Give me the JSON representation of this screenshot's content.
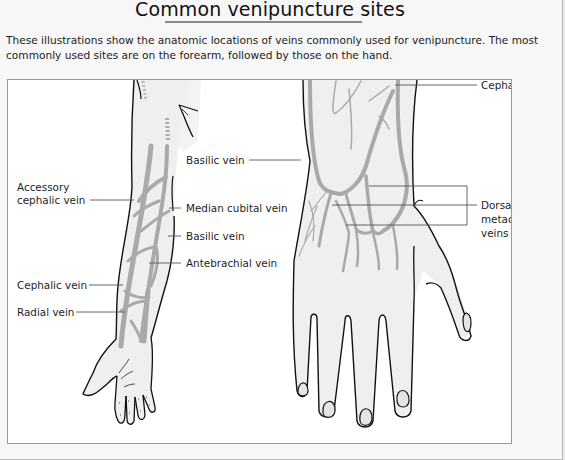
{
  "header": {
    "title": "Common venipuncture sites"
  },
  "intro": {
    "text": "These illustrations show the anatomic locations of veins commonly used for venipuncture. The most commonly used sites are on the forearm, followed by those on the hand."
  },
  "figure": {
    "arm_labels": {
      "accessory_cephalic_line1": "Accessory",
      "accessory_cephalic_line2": "cephalic vein",
      "basilic_upper": "Basilic vein",
      "median_cubital": "Median cubital vein",
      "basilic_lower": "Basilic vein",
      "antebrachial": "Antebrachial vein",
      "cephalic": "Cephalic vein",
      "radial": "Radial vein"
    },
    "hand_labels": {
      "cephalic": "Cephalic vein",
      "dorsal_metacarpal_line1": "Dorsal",
      "dorsal_metacarpal_line2": "metacarpal",
      "dorsal_metacarpal_line3": "veins"
    },
    "colors": {
      "vein": "#a9a9a9",
      "skin": "#efefef",
      "outline": "#111111",
      "leader_line": "#555555"
    }
  }
}
